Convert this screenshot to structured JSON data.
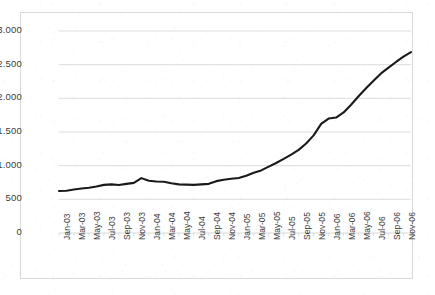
{
  "chart_data": {
    "type": "line",
    "title": "",
    "subtitle": "",
    "xlabel": "",
    "ylabel": "",
    "grid": true,
    "legend": false,
    "legend_position": "none",
    "line_color": "#1a1a1a",
    "gridline_color": "#d9d9d9",
    "border_color": "#d9d9d9",
    "background_color": "#ffffff",
    "ylim": [
      0,
      3000
    ],
    "ytick_step": 500,
    "ytick_labels": [
      "3.000",
      "2.500",
      "2.000",
      "1.500",
      "1.000",
      "500",
      "0"
    ],
    "ytick_values": [
      3000,
      2500,
      2000,
      1500,
      1000,
      500,
      0
    ],
    "xtick_labels": [
      "Jan-03",
      "Mar-03",
      "May-03",
      "Jul-03",
      "Sep-03",
      "Nov-03",
      "Jan-04",
      "Mar-04",
      "May-04",
      "Jul-04",
      "Sep-04",
      "Nov-04",
      "Jan-05",
      "Mar-05",
      "May-05",
      "Jul-05",
      "Sep-05",
      "Nov-05",
      "Jan-06",
      "Mar-06",
      "May-06",
      "Jul-06",
      "Sep-06",
      "Nov-06"
    ],
    "x": [
      "Jan-03",
      "Feb-03",
      "Mar-03",
      "Apr-03",
      "May-03",
      "Jun-03",
      "Jul-03",
      "Aug-03",
      "Sep-03",
      "Oct-03",
      "Nov-03",
      "Dec-03",
      "Jan-04",
      "Feb-04",
      "Mar-04",
      "Apr-04",
      "May-04",
      "Jun-04",
      "Jul-04",
      "Aug-04",
      "Sep-04",
      "Oct-04",
      "Nov-04",
      "Dec-04",
      "Jan-05",
      "Feb-05",
      "Mar-05",
      "Apr-05",
      "May-05",
      "Jun-05",
      "Jul-05",
      "Aug-05",
      "Sep-05",
      "Oct-05",
      "Nov-05",
      "Dec-05",
      "Jan-06",
      "Feb-06",
      "Mar-06",
      "Apr-06",
      "May-06",
      "Jun-06",
      "Jul-06",
      "Aug-06",
      "Sep-06",
      "Oct-06",
      "Nov-06",
      "Dec-06"
    ],
    "values": [
      623,
      628,
      645,
      660,
      672,
      690,
      715,
      722,
      712,
      730,
      745,
      815,
      775,
      765,
      762,
      740,
      722,
      718,
      715,
      722,
      730,
      770,
      790,
      805,
      818,
      850,
      895,
      930,
      985,
      1040,
      1100,
      1165,
      1235,
      1330,
      1450,
      1620,
      1700,
      1715,
      1790,
      1905,
      2030,
      2150,
      2260,
      2370,
      2455,
      2540,
      2620,
      2685
    ]
  }
}
